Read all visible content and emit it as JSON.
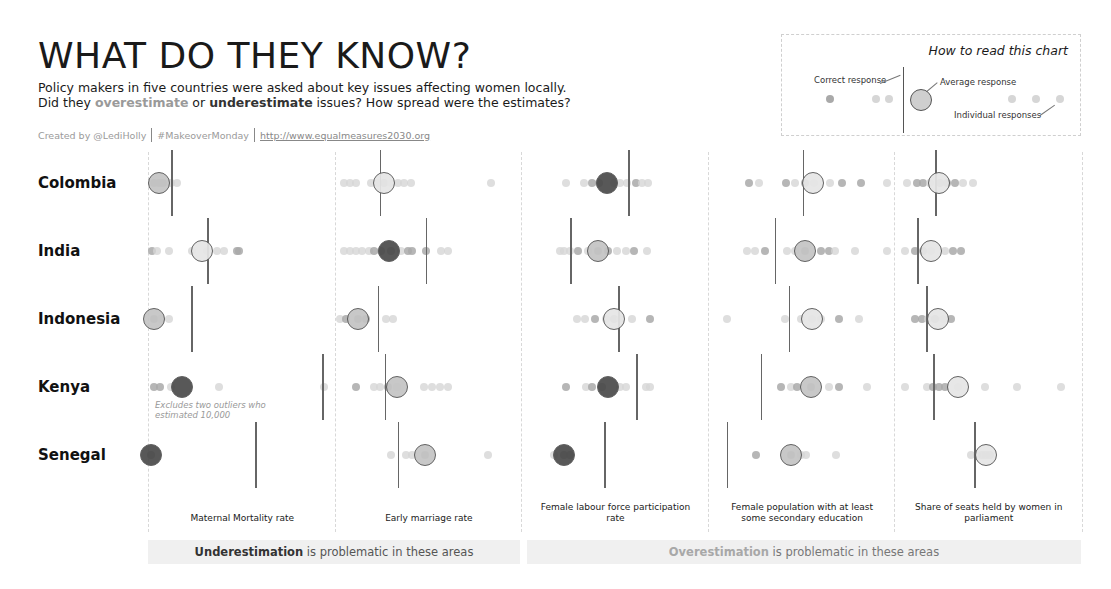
{
  "header": {
    "title": "WHAT DO THEY KNOW?",
    "subtitle_part1": "Policy makers in five countries were asked about key issues affecting women locally. Did they ",
    "subtitle_over": "overestimate",
    "subtitle_part2": " or ",
    "subtitle_under": "underestimate",
    "subtitle_part3": " issues? How spread were the estimates?",
    "credits": {
      "author": "Created by @LediHolly",
      "tag": "#MakeoverMonday",
      "link": "http://www.equalmeasures2030.org"
    }
  },
  "legend": {
    "title": "How to read this chart",
    "correct_label": "Correct response",
    "average_label": "Average response",
    "individual_label": "Individual responses"
  },
  "note": "Excludes two outliers who estimated 10,000",
  "bands": {
    "under_bold": "Underestimation",
    "under_rest": " is problematic in these areas",
    "over_bold": "Overestimation",
    "over_rest": " is problematic in these areas"
  },
  "colors": {
    "dot_light": "#d6d6d6",
    "dot_mid": "#a9a9a9",
    "dot_dark": "#8a8a8a",
    "avg_light": "#e6e6e6",
    "avg_mid": "#c4c4c4",
    "avg_dark": "#4a4a4a",
    "correct_line": "#666666",
    "band_bg": "#f0f0f0"
  },
  "chart_data": {
    "type": "scatter",
    "title": "WHAT DO THEY KNOW?",
    "rows": [
      "Colombia",
      "India",
      "Indonesia",
      "Kenya",
      "Senegal"
    ],
    "columns": [
      "Maternal Mortality rate",
      "Early marriage rate",
      "Female labour force participation rate",
      "Female population with at least some secondary education",
      "Share of seats held by women in parliament"
    ],
    "cells": [
      [
        {
          "correct": 22,
          "avg": 10,
          "avg_shade": "mid",
          "dots": [
            [
              5,
              "mid"
            ],
            [
              10,
              "mid"
            ],
            [
              14,
              "mid"
            ],
            [
              22,
              "light"
            ],
            [
              28,
              "light"
            ]
          ]
        },
        {
          "correct": 44,
          "avg": 48,
          "avg_shade": "light",
          "dots": [
            [
              8,
              "light"
            ],
            [
              14,
              "light"
            ],
            [
              20,
              "light"
            ],
            [
              35,
              "light"
            ],
            [
              42,
              "light"
            ],
            [
              48,
              "mid"
            ],
            [
              55,
              "light"
            ],
            [
              62,
              "light"
            ],
            [
              68,
              "light"
            ],
            [
              75,
              "light"
            ],
            [
              155,
              "light"
            ]
          ]
        },
        {
          "correct": 106,
          "avg": 85,
          "avg_shade": "dark",
          "dots": [
            [
              44,
              "light"
            ],
            [
              62,
              "light"
            ],
            [
              70,
              "mid"
            ],
            [
              77,
              "mid"
            ],
            [
              92,
              "light"
            ],
            [
              98,
              "light"
            ],
            [
              105,
              "light"
            ],
            [
              114,
              "mid"
            ],
            [
              120,
              "light"
            ],
            [
              126,
              "light"
            ]
          ]
        },
        {
          "correct": 94,
          "avg": 104,
          "avg_shade": "light",
          "dots": [
            [
              40,
              "mid"
            ],
            [
              50,
              "light"
            ],
            [
              77,
              "mid"
            ],
            [
              86,
              "light"
            ],
            [
              96,
              "mid"
            ],
            [
              105,
              "light"
            ],
            [
              121,
              "light"
            ],
            [
              133,
              "mid"
            ],
            [
              152,
              "mid"
            ],
            [
              178,
              "light"
            ]
          ]
        },
        {
          "correct": 40,
          "avg": 44,
          "avg_shade": "light",
          "dots": [
            [
              12,
              "light"
            ],
            [
              22,
              "mid"
            ],
            [
              28,
              "mid"
            ],
            [
              35,
              "light"
            ],
            [
              45,
              "mid"
            ],
            [
              52,
              "mid"
            ],
            [
              60,
              "mid"
            ],
            [
              68,
              "light"
            ],
            [
              78,
              "light"
            ]
          ]
        }
      ],
      [
        {
          "correct": 58,
          "avg": 53,
          "avg_shade": "light",
          "dots": [
            [
              3,
              "mid"
            ],
            [
              8,
              "light"
            ],
            [
              20,
              "light"
            ],
            [
              43,
              "light"
            ],
            [
              58,
              "light"
            ],
            [
              68,
              "light"
            ],
            [
              75,
              "light"
            ],
            [
              88,
              "mid"
            ],
            [
              90,
              "mid"
            ]
          ]
        },
        {
          "correct": 90,
          "avg": 53,
          "avg_shade": "dark",
          "dots": [
            [
              8,
              "light"
            ],
            [
              14,
              "light"
            ],
            [
              20,
              "light"
            ],
            [
              26,
              "light"
            ],
            [
              33,
              "light"
            ],
            [
              38,
              "mid"
            ],
            [
              45,
              "mid"
            ],
            [
              55,
              "mid"
            ],
            [
              65,
              "light"
            ],
            [
              72,
              "mid"
            ],
            [
              76,
              "mid"
            ],
            [
              90,
              "mid"
            ],
            [
              105,
              "light"
            ],
            [
              112,
              "light"
            ]
          ]
        },
        {
          "correct": 48,
          "avg": 76,
          "avg_shade": "mid",
          "dots": [
            [
              38,
              "light"
            ],
            [
              42,
              "light"
            ],
            [
              48,
              "light"
            ],
            [
              56,
              "mid"
            ],
            [
              66,
              "light"
            ],
            [
              76,
              "mid"
            ],
            [
              86,
              "mid"
            ],
            [
              95,
              "light"
            ],
            [
              104,
              "light"
            ],
            [
              112,
              "mid"
            ],
            [
              125,
              "light"
            ]
          ]
        },
        {
          "correct": 66,
          "avg": 96,
          "avg_shade": "mid",
          "dots": [
            [
              38,
              "light"
            ],
            [
              46,
              "light"
            ],
            [
              56,
              "mid"
            ],
            [
              78,
              "light"
            ],
            [
              86,
              "light"
            ],
            [
              96,
              "mid"
            ],
            [
              112,
              "mid"
            ],
            [
              120,
              "mid"
            ],
            [
              126,
              "light"
            ],
            [
              146,
              "light"
            ],
            [
              178,
              "light"
            ]
          ]
        },
        {
          "correct": 22,
          "avg": 36,
          "avg_shade": "light",
          "dots": [
            [
              10,
              "light"
            ],
            [
              20,
              "mid"
            ],
            [
              28,
              "mid"
            ],
            [
              36,
              "light"
            ],
            [
              50,
              "light"
            ],
            [
              58,
              "mid"
            ],
            [
              66,
              "mid"
            ]
          ]
        }
      ],
      [
        {
          "correct": 42,
          "avg": 5,
          "avg_shade": "mid",
          "dots": [
            [
              5,
              "mid"
            ],
            [
              12,
              "light"
            ],
            [
              20,
              "light"
            ]
          ]
        },
        {
          "correct": 42,
          "avg": 22,
          "avg_shade": "mid",
          "dots": [
            [
              4,
              "light"
            ],
            [
              10,
              "mid"
            ],
            [
              22,
              "mid"
            ],
            [
              30,
              "mid"
            ],
            [
              50,
              "light"
            ],
            [
              57,
              "light"
            ]
          ]
        },
        {
          "correct": 96,
          "avg": 92,
          "avg_shade": "light",
          "dots": [
            [
              55,
              "light"
            ],
            [
              63,
              "light"
            ],
            [
              73,
              "mid"
            ],
            [
              84,
              "light"
            ],
            [
              92,
              "mid"
            ],
            [
              98,
              "light"
            ],
            [
              110,
              "light"
            ],
            [
              128,
              "mid"
            ]
          ]
        },
        {
          "correct": 80,
          "avg": 103,
          "avg_shade": "light",
          "dots": [
            [
              18,
              "light"
            ],
            [
              76,
              "light"
            ],
            [
              92,
              "light"
            ],
            [
              103,
              "light"
            ],
            [
              112,
              "light"
            ],
            [
              130,
              "mid"
            ],
            [
              150,
              "light"
            ]
          ]
        },
        {
          "correct": 31,
          "avg": 43,
          "avg_shade": "light",
          "dots": [
            [
              20,
              "mid"
            ],
            [
              27,
              "mid"
            ],
            [
              33,
              "light"
            ],
            [
              40,
              "mid"
            ],
            [
              48,
              "light"
            ],
            [
              56,
              "mid"
            ]
          ]
        }
      ],
      [
        {
          "correct": 173,
          "avg": 33,
          "avg_shade": "dark",
          "dots": [
            [
              5,
              "mid"
            ],
            [
              11,
              "mid"
            ],
            [
              22,
              "light"
            ],
            [
              70,
              "light"
            ],
            [
              175,
              "light"
            ]
          ]
        },
        {
          "correct": 49,
          "avg": 61,
          "avg_shade": "mid",
          "dots": [
            [
              20,
              "mid"
            ],
            [
              38,
              "light"
            ],
            [
              44,
              "light"
            ],
            [
              52,
              "mid"
            ],
            [
              61,
              "light"
            ],
            [
              88,
              "light"
            ],
            [
              96,
              "light"
            ],
            [
              104,
              "light"
            ],
            [
              112,
              "light"
            ]
          ]
        },
        {
          "correct": 114,
          "avg": 86,
          "avg_shade": "dark",
          "dots": [
            [
              44,
              "mid"
            ],
            [
              64,
              "light"
            ],
            [
              70,
              "mid"
            ],
            [
              80,
              "mid"
            ],
            [
              98,
              "light"
            ],
            [
              104,
              "light"
            ],
            [
              124,
              "light"
            ],
            [
              128,
              "light"
            ]
          ]
        },
        {
          "correct": 52,
          "avg": 102,
          "avg_shade": "mid",
          "dots": [
            [
              72,
              "mid"
            ],
            [
              82,
              "light"
            ],
            [
              88,
              "mid"
            ],
            [
              102,
              "mid"
            ],
            [
              120,
              "light"
            ],
            [
              130,
              "mid"
            ],
            [
              158,
              "light"
            ]
          ]
        },
        {
          "correct": 38,
          "avg": 63,
          "avg_shade": "light",
          "dots": [
            [
              10,
              "light"
            ],
            [
              32,
              "light"
            ],
            [
              38,
              "mid"
            ],
            [
              44,
              "mid"
            ],
            [
              50,
              "mid"
            ],
            [
              63,
              "light"
            ],
            [
              90,
              "light"
            ],
            [
              122,
              "light"
            ],
            [
              166,
              "light"
            ]
          ]
        }
      ],
      [
        {
          "correct": 106,
          "avg": 2,
          "avg_shade": "dark",
          "dots": [
            [
              2,
              "mid"
            ]
          ]
        },
        {
          "correct": 62,
          "avg": 89,
          "avg_shade": "mid",
          "dots": [
            [
              55,
              "light"
            ],
            [
              70,
              "light"
            ],
            [
              76,
              "light"
            ],
            [
              89,
              "mid"
            ],
            [
              152,
              "light"
            ]
          ]
        },
        {
          "correct": 82,
          "avg": 42,
          "avg_shade": "dark",
          "dots": [
            [
              32,
              "light"
            ],
            [
              42,
              "mid"
            ],
            [
              48,
              "mid"
            ]
          ]
        },
        {
          "correct": 18,
          "avg": 82,
          "avg_shade": "mid",
          "dots": [
            [
              47,
              "mid"
            ],
            [
              82,
              "mid"
            ],
            [
              92,
              "light"
            ],
            [
              97,
              "light"
            ],
            [
              127,
              "light"
            ]
          ]
        },
        {
          "correct": 79,
          "avg": 91,
          "avg_shade": "light",
          "dots": [
            [
              76,
              "light"
            ],
            [
              82,
              "light"
            ],
            [
              87,
              "mid"
            ],
            [
              91,
              "mid"
            ],
            [
              95,
              "mid"
            ]
          ]
        }
      ]
    ],
    "legend_entries": [
      "Correct response",
      "Average response",
      "Individual responses"
    ],
    "annotations": [
      "Excludes two outliers who estimated 10,000"
    ],
    "grid": false
  }
}
